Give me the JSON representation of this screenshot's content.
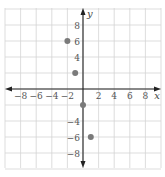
{
  "chart_data": {
    "type": "scatter",
    "title": "",
    "xlabel": "x",
    "ylabel": "y",
    "xlim": [
      -10,
      10
    ],
    "ylim": [
      -10,
      10
    ],
    "grid": true,
    "grid_step": 2,
    "x_ticks": [
      -8,
      -6,
      -4,
      -2,
      2,
      4,
      6,
      8
    ],
    "y_ticks": [
      8,
      6,
      4,
      -4,
      -6,
      -8
    ],
    "x_tick_labels": [
      "−8",
      "−6",
      "−4",
      "−2",
      "2",
      "4",
      "6",
      "8"
    ],
    "y_tick_labels": [
      "8",
      "6",
      "4",
      "−4",
      "−6",
      "−8"
    ],
    "series": [
      {
        "name": "points",
        "points": [
          {
            "x": -2,
            "y": 6
          },
          {
            "x": -1,
            "y": 2
          },
          {
            "x": 0,
            "y": -2
          },
          {
            "x": 1,
            "y": -6
          }
        ]
      }
    ],
    "legend": null
  },
  "colors": {
    "grid": "#d4d4d4",
    "axis": "#222222",
    "point": "#7a7a7a",
    "text": "#555555"
  }
}
